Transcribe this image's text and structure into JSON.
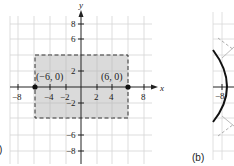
{
  "colors": {
    "background": "#ffffff",
    "grid": "#d4d4d4",
    "shade": "#d3d3d3",
    "axis": "#222222",
    "dashed": "#333333",
    "point": "#111111",
    "curve": "#111111"
  },
  "panel_a": {
    "label": ")",
    "axis_x_label": "x",
    "axis_y_label": "y",
    "x_ticks": [
      {
        "value": -8,
        "label": "−8"
      },
      {
        "value": -4,
        "label": "−4"
      },
      {
        "value": -2,
        "label": "−2"
      },
      {
        "value": 2,
        "label": "2"
      },
      {
        "value": 4,
        "label": "4"
      },
      {
        "value": 8,
        "label": "8"
      }
    ],
    "y_ticks": [
      {
        "value": 8,
        "label": "8"
      },
      {
        "value": 6,
        "label": "6"
      },
      {
        "value": 2,
        "label": "2"
      },
      {
        "value": -2,
        "label": "−2"
      },
      {
        "value": -6,
        "label": "−6"
      },
      {
        "value": -8,
        "label": "−8"
      }
    ],
    "rectangle": {
      "x_min": -6,
      "x_max": 6,
      "y_min": -4,
      "y_max": 4,
      "style": "dashed, shaded"
    },
    "points": [
      {
        "x": -6,
        "y": 0,
        "label": "(−6, 0)"
      },
      {
        "x": 6,
        "y": 0,
        "label": "(6, 0)"
      }
    ]
  },
  "panel_b": {
    "label": "(b)",
    "x_tick_label": "−8"
  }
}
